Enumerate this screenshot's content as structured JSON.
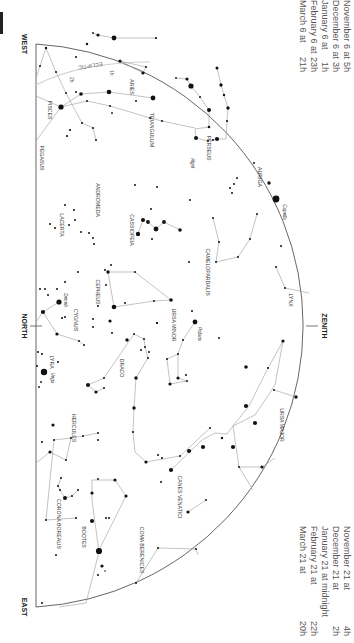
{
  "chart_meta": {
    "orientation": "rotated-90-clockwise",
    "colors": {
      "background": "#ffffff",
      "line": "#9a9a9a",
      "horizon": "#555555",
      "star": "#111111",
      "text": "#333333",
      "ecliptic": "#c8c8c8"
    }
  },
  "directions": {
    "west": "WEST",
    "north": "NORTH",
    "east": "EAST",
    "zenith": "ZENITH"
  },
  "times_left": [
    {
      "label": "November 6 at",
      "value": "5h"
    },
    {
      "label": "December 6 at",
      "value": "3h"
    },
    {
      "label": "January 6 at",
      "value": "1h"
    },
    {
      "label": "February 6 at",
      "value": "23h"
    },
    {
      "label": "March 6 at",
      "value": "21h"
    }
  ],
  "times_right": [
    {
      "label": "November 21 at",
      "value": "4h"
    },
    {
      "label": "December 21 at",
      "value": "2h"
    },
    {
      "label": "January 21 at midnight",
      "value": ""
    },
    {
      "label": "February 21 at",
      "value": "22h"
    },
    {
      "label": "March 21 at",
      "value": "20h"
    }
  ],
  "ecliptic": {
    "label": "ECLIPTIC",
    "markers": [
      "1h",
      "2h"
    ]
  },
  "constellations": [
    {
      "name": "PISCES",
      "x": 48,
      "y": 110
    },
    {
      "name": "ARIES",
      "x": 130,
      "y": 87
    },
    {
      "name": "TRIANGULUM",
      "x": 150,
      "y": 130
    },
    {
      "name": "PERSEUS",
      "x": 207,
      "y": 148
    },
    {
      "name": "PEGASUS",
      "x": 40,
      "y": 158
    },
    {
      "name": "ANDROMEDA",
      "x": 96,
      "y": 200
    },
    {
      "name": "AURIGA",
      "x": 258,
      "y": 177
    },
    {
      "name": "LACERTA",
      "x": 60,
      "y": 225
    },
    {
      "name": "CASSIOPEIA",
      "x": 130,
      "y": 230
    },
    {
      "name": "CAMELOPARDALIS",
      "x": 206,
      "y": 272
    },
    {
      "name": "CEPHEUS",
      "x": 96,
      "y": 292
    },
    {
      "name": "LYNX",
      "x": 289,
      "y": 300
    },
    {
      "name": "CYGNUS",
      "x": 74,
      "y": 320
    },
    {
      "name": "URSA MINOR",
      "x": 172,
      "y": 325
    },
    {
      "name": "LYRA",
      "x": 50,
      "y": 362
    },
    {
      "name": "DRACO",
      "x": 120,
      "y": 368
    },
    {
      "name": "HERCULES",
      "x": 72,
      "y": 428
    },
    {
      "name": "URSA MAJOR",
      "x": 280,
      "y": 425
    },
    {
      "name": "CANES VENATICI",
      "x": 178,
      "y": 497
    },
    {
      "name": "CORONA BOREALIS",
      "x": 57,
      "y": 524
    },
    {
      "name": "BOOTES",
      "x": 82,
      "y": 537
    },
    {
      "name": "COMA BERENICES",
      "x": 140,
      "y": 550
    }
  ],
  "named_stars": [
    {
      "name": "Algol",
      "x": 191,
      "y": 163
    },
    {
      "name": "Capella",
      "x": 276,
      "y": 205
    },
    {
      "name": "Deneb",
      "x": 64,
      "y": 300
    },
    {
      "name": "Polaris",
      "x": 196,
      "y": 330
    },
    {
      "name": "Vega",
      "x": 50,
      "y": 378
    }
  ]
}
